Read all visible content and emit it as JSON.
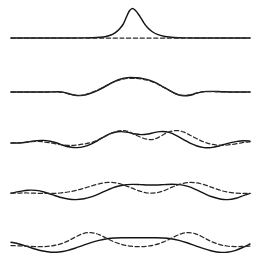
{
  "figure": {
    "width": 259,
    "height": 267,
    "background_color": "#ffffff",
    "solid_color": "#141414",
    "dashed_color": "#2a2a2a",
    "panel_count": 5,
    "x_domain": [
      11,
      250
    ],
    "panel_baselines": [
      38,
      92,
      143,
      193,
      243
    ],
    "legend": {
      "solid_label": "",
      "dashed_label": ""
    }
  },
  "chart_data": {
    "type": "line",
    "subtitle": "",
    "xlabel": "",
    "ylabel": "",
    "grid": false,
    "axes_visible": false,
    "legend_position": "none",
    "tick_labels_x": [],
    "tick_labels_y": [],
    "annotations": [],
    "panels": [
      {
        "index": 0,
        "name": "panel-stage-1",
        "baseline_y": 38,
        "description": "Initial narrow Gaussian pulse on a flat baseline; dashed reference curve coincides with the baseline under the pulse.",
        "series": [
          {
            "name": "solid",
            "style": "solid",
            "x": [
              11,
              25,
              40,
              55,
              70,
              82,
              92,
              100,
              106,
              111,
              115,
              119,
              123,
              126,
              129,
              132,
              135,
              139,
              143,
              147,
              152,
              158,
              165,
              174,
              185,
              198,
              212,
              228,
              250
            ],
            "y": [
              38.0,
              38.0,
              38.0,
              38.0,
              38.0,
              37.9,
              37.7,
              37.3,
              36.5,
              35.0,
              32.8,
              29.5,
              24.5,
              18.0,
              11.5,
              8.6,
              10.0,
              15.0,
              21.5,
              27.0,
              31.5,
              34.6,
              36.5,
              37.5,
              37.9,
              38.0,
              38.0,
              38.0,
              38.0
            ]
          },
          {
            "name": "dashed",
            "style": "dashed",
            "x": [
              11,
              40,
              70,
              95,
              115,
              129,
              145,
              165,
              190,
              215,
              250
            ],
            "y": [
              38.0,
              38.0,
              38.0,
              38.0,
              38.0,
              38.0,
              38.0,
              38.0,
              38.0,
              38.0,
              38.0
            ]
          }
        ]
      },
      {
        "index": 1,
        "name": "panel-stage-2",
        "baseline_y": 92,
        "description": "Pulse has broadened and lowered; small negative side lobes appear on both flanks. Dashed curve nearly coincides with solid.",
        "series": [
          {
            "name": "solid",
            "style": "solid",
            "x": [
              11,
              30,
              48,
              58,
              64,
              70,
              75,
              80,
              86,
              92,
              99,
              106,
              113,
              120,
              128,
              136,
              143,
              150,
              157,
              163,
              169,
              174,
              179,
              184,
              190,
              196,
              203,
              212,
              224,
              238,
              250
            ],
            "y": [
              92.0,
              92.0,
              92.0,
              91.8,
              92.4,
              94.0,
              95.3,
              95.6,
              94.8,
              92.8,
              89.8,
              86.0,
              82.2,
              79.2,
              77.6,
              77.8,
              78.6,
              80.4,
              83.4,
              86.8,
              90.2,
              93.0,
              95.0,
              95.7,
              95.2,
              93.4,
              91.6,
              91.4,
              91.8,
              92.0,
              92.0
            ]
          },
          {
            "name": "dashed",
            "style": "dashed",
            "x": [
              11,
              30,
              48,
              58,
              64,
              70,
              75,
              80,
              86,
              92,
              99,
              106,
              113,
              120,
              128,
              136,
              143,
              150,
              157,
              163,
              169,
              174,
              179,
              184,
              190,
              196,
              203,
              212,
              224,
              238,
              250
            ],
            "y": [
              92.0,
              92.0,
              92.0,
              92.0,
              92.6,
              94.2,
              95.2,
              95.4,
              94.4,
              92.4,
              89.4,
              85.8,
              82.4,
              79.8,
              78.4,
              78.4,
              79.2,
              81.0,
              83.8,
              87.0,
              90.2,
              93.0,
              94.8,
              95.4,
              94.8,
              93.2,
              91.8,
              91.6,
              92.0,
              92.0,
              92.0
            ]
          }
        ]
      },
      {
        "index": 2,
        "name": "panel-stage-3",
        "baseline_y": 143,
        "description": "Central hump splits into two crests with a shallow trough between; dashed curve dips markedly deeper in the middle and rides slightly above at the crests.",
        "series": [
          {
            "name": "solid",
            "style": "solid",
            "x": [
              11,
              22,
              30,
              37,
              43,
              50,
              57,
              63,
              70,
              77,
              84,
              91,
              97,
              103,
              109,
              115,
              121,
              128,
              134,
              141,
              148,
              154,
              160,
              166,
              172,
              178,
              184,
              190,
              197,
              204,
              211,
              219,
              227,
              236,
              244,
              250
            ],
            "y": [
              143.0,
              142.8,
              141.6,
              140.6,
              140.4,
              141.2,
              143.0,
              145.2,
              147.0,
              147.6,
              146.6,
              144.2,
              141.0,
              137.4,
              134.2,
              132.2,
              131.6,
              132.4,
              133.8,
              134.6,
              134.0,
              132.6,
              131.6,
              131.8,
              133.4,
              136.4,
              139.8,
              143.2,
              146.0,
              147.6,
              147.6,
              146.0,
              143.6,
              141.6,
              140.8,
              141.2
            ]
          },
          {
            "name": "dashed",
            "style": "dashed",
            "x": [
              11,
              22,
              30,
              37,
              43,
              50,
              57,
              63,
              70,
              77,
              84,
              91,
              97,
              103,
              109,
              115,
              121,
              128,
              134,
              141,
              148,
              154,
              160,
              166,
              172,
              178,
              184,
              190,
              197,
              204,
              211,
              219,
              227,
              236,
              244,
              250
            ],
            "y": [
              143.0,
              142.6,
              141.8,
              141.4,
              141.8,
              142.8,
              144.0,
              145.0,
              145.4,
              145.0,
              144.0,
              142.6,
              140.4,
              137.4,
              134.4,
              131.8,
              130.6,
              131.4,
              134.2,
              137.4,
              139.4,
              139.2,
              136.6,
              133.2,
              131.0,
              130.6,
              132.2,
              135.2,
              138.8,
              142.0,
              144.2,
              145.2,
              145.0,
              143.8,
              142.4,
              141.8
            ]
          }
        ]
      },
      {
        "index": 3,
        "name": "panel-stage-4",
        "baseline_y": 193,
        "description": "Solid curve flattens across the centre while the dashed curve develops higher crests and a deep central trough; the two cross repeatedly.",
        "series": [
          {
            "name": "solid",
            "style": "solid",
            "x": [
              11,
              20,
              28,
              36,
              44,
              52,
              60,
              68,
              76,
              84,
              92,
              100,
              108,
              116,
              124,
              132,
              140,
              148,
              156,
              164,
              172,
              180,
              188,
              196,
              204,
              212,
              220,
              228,
              236,
              244,
              250
            ],
            "y": [
              193.2,
              191.4,
              190.2,
              190.4,
              192.0,
              194.6,
              197.2,
              199.0,
              199.6,
              198.8,
              196.6,
              193.4,
              189.8,
              186.8,
              185.0,
              184.4,
              184.6,
              185.0,
              185.0,
              184.6,
              184.2,
              184.6,
              186.4,
              189.6,
              193.4,
              196.8,
              199.0,
              199.6,
              198.2,
              195.4,
              193.4
            ]
          },
          {
            "name": "dashed",
            "style": "dashed",
            "x": [
              11,
              20,
              28,
              36,
              44,
              52,
              60,
              68,
              76,
              84,
              92,
              100,
              108,
              116,
              124,
              132,
              140,
              148,
              156,
              164,
              172,
              180,
              188,
              196,
              204,
              212,
              220,
              228,
              236,
              244,
              250
            ],
            "y": [
              193.0,
              193.0,
              193.0,
              193.2,
              193.4,
              193.4,
              193.0,
              192.0,
              190.4,
              188.2,
              185.8,
              183.6,
              182.4,
              182.8,
              185.0,
              188.2,
              191.2,
              193.0,
              192.8,
              190.6,
              187.2,
              184.2,
              182.6,
              182.8,
              184.6,
              187.4,
              190.2,
              192.2,
              193.2,
              193.4,
              193.4
            ]
          }
        ]
      },
      {
        "index": 4,
        "name": "panel-stage-5",
        "baseline_y": 243,
        "description": "Dashed curve forms two tall narrow peaks with a broad depressed centre; solid curve remains broad and flat-topped, crossing the dashed curve four times.",
        "series": [
          {
            "name": "solid",
            "style": "solid",
            "x": [
              11,
              19,
              27,
              35,
              43,
              51,
              59,
              67,
              75,
              83,
              91,
              99,
              107,
              115,
              123,
              131,
              139,
              147,
              155,
              163,
              171,
              179,
              187,
              195,
              203,
              211,
              219,
              227,
              235,
              243,
              250
            ],
            "y": [
              242.2,
              244.0,
              246.4,
              249.0,
              251.0,
              252.2,
              252.0,
              250.6,
              248.2,
              245.4,
              242.6,
              240.4,
              238.8,
              238.0,
              237.8,
              237.8,
              237.8,
              237.8,
              237.8,
              238.0,
              238.8,
              240.4,
              242.8,
              245.6,
              248.4,
              250.8,
              252.2,
              252.2,
              250.6,
              247.4,
              244.0
            ]
          },
          {
            "name": "dashed",
            "style": "dashed",
            "x": [
              11,
              19,
              27,
              35,
              43,
              51,
              59,
              67,
              75,
              83,
              91,
              99,
              107,
              115,
              123,
              131,
              139,
              147,
              155,
              163,
              171,
              179,
              187,
              195,
              203,
              211,
              219,
              227,
              235,
              243,
              250
            ],
            "y": [
              245.6,
              245.8,
              246.2,
              246.6,
              246.6,
              246.0,
              244.4,
              241.4,
              237.2,
              233.6,
              232.6,
              234.6,
              238.4,
              242.2,
              244.8,
              246.2,
              246.6,
              246.2,
              244.8,
              242.2,
              238.4,
              234.6,
              232.6,
              233.6,
              237.2,
              241.4,
              244.4,
              246.0,
              246.6,
              246.4,
              246.0
            ]
          }
        ]
      }
    ]
  }
}
